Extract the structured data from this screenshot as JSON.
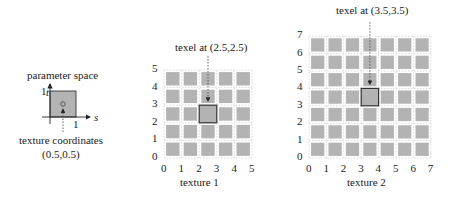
{
  "parameter_space": {
    "title": "parameter space",
    "axis_t": "t",
    "axis_s": "s",
    "tick_t": "1",
    "tick_s": "1",
    "caption_line1": "texture coordinates",
    "caption_line2": "(0.5,0.5)"
  },
  "texture1": {
    "title": "texel at (2.5,2.5)",
    "caption": "texture 1",
    "size": 5,
    "highlight": [
      2,
      2
    ],
    "x_ticks": [
      "0",
      "1",
      "2",
      "3",
      "4",
      "5"
    ],
    "y_ticks": [
      "0",
      "1",
      "2",
      "3",
      "4",
      "5"
    ]
  },
  "texture2": {
    "title": "texel at (3.5,3.5)",
    "caption": "texture 2",
    "size": 7,
    "highlight": [
      3,
      3
    ],
    "x_ticks": [
      "0",
      "1",
      "2",
      "3",
      "4",
      "5",
      "6",
      "7"
    ],
    "y_ticks": [
      "0",
      "1",
      "2",
      "3",
      "4",
      "5",
      "6",
      "7"
    ]
  },
  "colors": {
    "cell": "#b3b3b3",
    "grid": "#cfcfcf",
    "highlight_border": "#333333",
    "axis": "#222222"
  }
}
